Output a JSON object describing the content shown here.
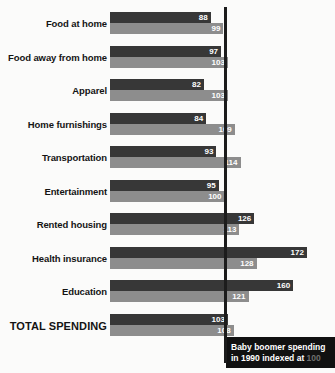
{
  "top_sliver_text": "",
  "caption": {
    "line1": "Baby boomer spending",
    "line2_prefix": "in 1990 indexed at ",
    "line2_value": "100"
  },
  "colors": {
    "dark_bar": "#373737",
    "light_bar": "#8d8d8d",
    "reference_line": "#1c1c1c",
    "caption_background": "#111111",
    "caption_text": "#ffffff",
    "caption_accent": "#6f6f6f",
    "background": "#fbfbfa",
    "label_text": "#141414"
  },
  "chart_data": {
    "type": "bar",
    "orientation": "horizontal",
    "title": "",
    "subtitle": "",
    "xlabel": "",
    "ylabel": "",
    "xlim": [
      0,
      185
    ],
    "grid": false,
    "legend_position": "none",
    "reference_value": 100,
    "reference_note": "Baby boomer spending in 1990 indexed at 100",
    "categories": [
      "Food at home",
      "Food away from home",
      "Apparel",
      "Home furnishings",
      "Transportation",
      "Entertainment",
      "Rented housing",
      "Health insurance",
      "Education",
      "TOTAL SPENDING"
    ],
    "series": [
      {
        "name": "dark",
        "values": [
          88,
          97,
          82,
          84,
          93,
          95,
          126,
          172,
          160,
          103
        ]
      },
      {
        "name": "light",
        "values": [
          99,
          103,
          103,
          109,
          114,
          100,
          113,
          128,
          121,
          108
        ]
      }
    ]
  }
}
